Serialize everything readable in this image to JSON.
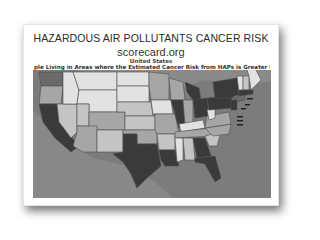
{
  "document": {
    "title": "HAZARDOUS AIR POLLUTANTS CANCER RISK",
    "source": "scorecard.org",
    "region": "United States",
    "subtitle": "ple Living in Areas where the Estimated Cancer Risk from HAPs is Greater t"
  },
  "map": {
    "type": "choropleth",
    "subject": "Estimated cancer risk from hazardous air pollutants by state",
    "colors": {
      "water": "#7c7c7c",
      "land_outside": "#8a8a8a",
      "lowest": "#e2e2e2",
      "low": "#c4c4c4",
      "medium": "#a6a6a6",
      "high": "#6a6a6a",
      "highest": "#3a3a3a",
      "border": "#4d4d4d"
    }
  }
}
